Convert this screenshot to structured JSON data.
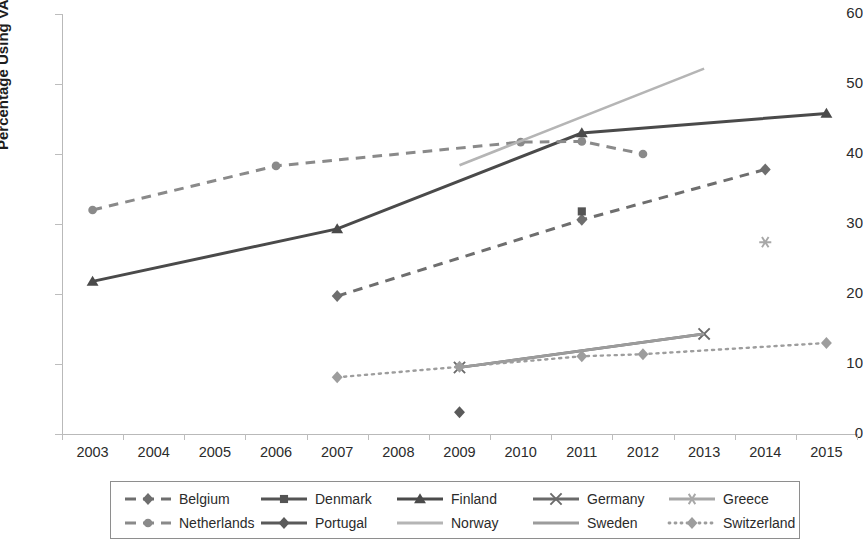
{
  "chart_data": {
    "type": "line",
    "title": "",
    "xlabel": "",
    "ylabel": "Percentage Using VAA",
    "x_tick_labels": [
      "2003",
      "2004",
      "2005",
      "2006",
      "2007",
      "2008",
      "2009",
      "2010",
      "2011",
      "2012",
      "2013",
      "2014",
      "2015"
    ],
    "y_tick_labels": [
      "0",
      "10",
      "20",
      "30",
      "40",
      "50",
      "60"
    ],
    "ylim": [
      0,
      60
    ],
    "xlim": [
      "2003",
      "2015"
    ],
    "grid": false,
    "legend_position": "bottom",
    "series": [
      {
        "name": "Belgium",
        "marker": "diamond",
        "line": "dashed",
        "color": "#6e6e6e",
        "x": [
          "2007",
          "2011",
          "2014"
        ],
        "values": [
          19.7,
          30.6,
          37.8
        ]
      },
      {
        "name": "Denmark",
        "marker": "square",
        "line": "solid",
        "color": "#545454",
        "x": [
          "2011"
        ],
        "values": [
          31.8
        ]
      },
      {
        "name": "Finland",
        "marker": "triangle",
        "line": "solid",
        "color": "#4a4a4a",
        "x": [
          "2003",
          "2007",
          "2011",
          "2015"
        ],
        "values": [
          21.8,
          29.3,
          43.0,
          45.8
        ]
      },
      {
        "name": "Germany",
        "marker": "x",
        "line": "solid",
        "color": "#6a6a6a",
        "x": [
          "2009",
          "2013"
        ],
        "values": [
          9.5,
          14.3
        ]
      },
      {
        "name": "Greece",
        "marker": "star",
        "line": "solid",
        "color": "#a8a8a8",
        "x": [
          "2014"
        ],
        "values": [
          27.4
        ]
      },
      {
        "name": "Netherlands",
        "marker": "circle",
        "line": "dashed",
        "color": "#8a8a8a",
        "x": [
          "2003",
          "2006",
          "2010",
          "2011",
          "2012"
        ],
        "values": [
          32.0,
          38.3,
          41.7,
          41.8,
          40.0
        ]
      },
      {
        "name": "Portugal",
        "marker": "diamond",
        "line": "solid",
        "color": "#5a5a5a",
        "x": [
          "2009"
        ],
        "values": [
          3.1
        ]
      },
      {
        "name": "Norway",
        "marker": "none",
        "line": "solid",
        "color": "#b5b5b5",
        "x": [
          "2009",
          "2013"
        ],
        "values": [
          38.4,
          52.2
        ]
      },
      {
        "name": "Sweden",
        "marker": "none",
        "line": "solid",
        "color": "#9c9c9c",
        "x": [
          "2009",
          "2013"
        ],
        "values": [
          9.5,
          14.3
        ]
      },
      {
        "name": "Switzerland",
        "marker": "diamond",
        "line": "dotted",
        "color": "#9d9d9d",
        "x": [
          "2007",
          "2009",
          "2011",
          "2012",
          "2015"
        ],
        "values": [
          8.1,
          9.6,
          11.1,
          11.4,
          13.0
        ]
      }
    ]
  },
  "legend": {
    "row1": [
      {
        "label": "Belgium",
        "icon": "dashed-diamond-marker-icon"
      },
      {
        "label": "Denmark",
        "icon": "solid-square-marker-icon"
      },
      {
        "label": "Finland",
        "icon": "solid-triangle-marker-icon"
      },
      {
        "label": "Germany",
        "icon": "solid-x-marker-icon"
      },
      {
        "label": "Greece",
        "icon": "solid-star-marker-icon"
      }
    ],
    "row2": [
      {
        "label": "Netherlands",
        "icon": "dashed-circle-marker-icon"
      },
      {
        "label": "Portugal",
        "icon": "solid-diamond-marker-icon"
      },
      {
        "label": "Norway",
        "icon": "solid-line-icon"
      },
      {
        "label": "Sweden",
        "icon": "solid-line-icon"
      },
      {
        "label": "Switzerland",
        "icon": "dotted-diamond-marker-icon"
      }
    ]
  }
}
